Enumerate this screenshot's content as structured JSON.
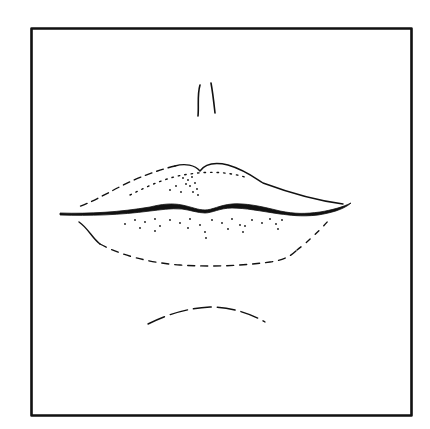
{
  "figure": {
    "ink_color": "#111111",
    "background_color": "#ffffff",
    "elements": [
      "square-frame",
      "philtrum-lines",
      "upper-lip",
      "lip-seam",
      "lower-lip",
      "chin-crease"
    ]
  }
}
